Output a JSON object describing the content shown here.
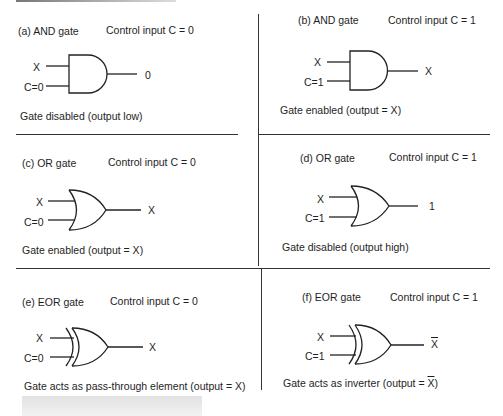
{
  "panels": [
    {
      "label": "(a) AND gate",
      "control": "Control input C = 0",
      "gate_type": "AND",
      "input_x": "X",
      "input_c": "C=0",
      "output": "0",
      "output_overline": false,
      "caption": "Gate disabled (output low)",
      "caption_overline_x": false
    },
    {
      "label": "(b) AND gate",
      "control": "Control input C = 1",
      "gate_type": "AND",
      "input_x": "X",
      "input_c": "C=1",
      "output": "X",
      "output_overline": false,
      "caption": "Gate enabled (output = X)",
      "caption_overline_x": false
    },
    {
      "label": "(c) OR gate",
      "control": "Control input C = 0",
      "gate_type": "OR",
      "input_x": "X",
      "input_c": "C=0",
      "output": "X",
      "output_overline": false,
      "caption": "Gate enabled (output = X)",
      "caption_overline_x": false
    },
    {
      "label": "(d) OR gate",
      "control": "Control input C = 1",
      "gate_type": "OR",
      "input_x": "X",
      "input_c": "C=1",
      "output": "1",
      "output_overline": false,
      "caption": "Gate disabled (output high)",
      "caption_overline_x": false
    },
    {
      "label": "(e) EOR gate",
      "control": "Control input C = 0",
      "gate_type": "XOR",
      "input_x": "X",
      "input_c": "C=0",
      "output": "X",
      "output_overline": false,
      "caption": "Gate acts as pass-through element (output = X)",
      "caption_overline_x": false
    },
    {
      "label": "(f) EOR gate",
      "control": "Control input C = 1",
      "gate_type": "XOR",
      "input_x": "X",
      "input_c": "C=1",
      "output": "X",
      "output_overline": true,
      "caption_prefix": "Gate acts as inverter (output = ",
      "caption_x": "X",
      "caption_suffix": ")",
      "caption_overline_x": true
    }
  ]
}
